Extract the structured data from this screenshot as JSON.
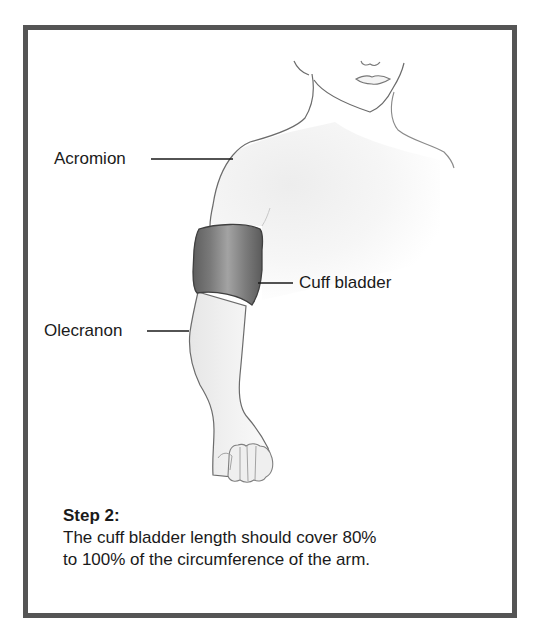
{
  "figure": {
    "labels": {
      "acromion": "Acromion",
      "cuff_bladder": "Cuff bladder",
      "olecranon": "Olecranon"
    },
    "caption": {
      "step": "Step 2:",
      "text_line1": "The cuff bladder length should cover 80%",
      "text_line2": "to 100% of the circumference of the arm."
    },
    "colors": {
      "frame": "#555555",
      "outline": "#6b6b6b",
      "skin_shade": "#ececec",
      "cuff_dark": "#5a5a5a",
      "cuff_light": "#9a9a9a",
      "text": "#1a1a1a"
    }
  }
}
